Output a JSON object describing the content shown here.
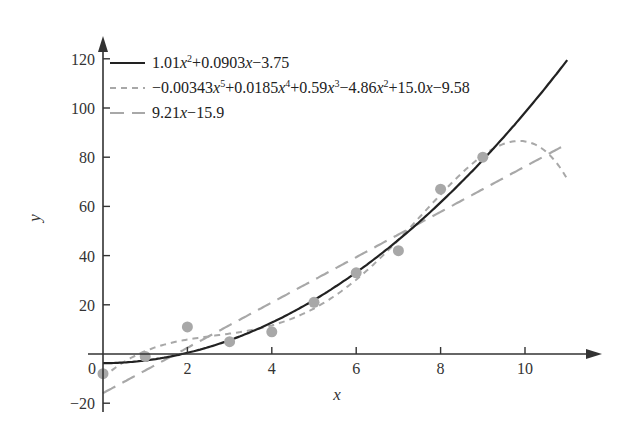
{
  "chart_data": {
    "type": "scatter",
    "title": "",
    "xlabel": "x",
    "ylabel": "y",
    "xlim": [
      0,
      11.5
    ],
    "ylim": [
      -22,
      125
    ],
    "x_ticks": [
      "0",
      "2",
      "4",
      "6",
      "8",
      "10"
    ],
    "y_ticks": [
      "-20",
      "0",
      "20",
      "40",
      "60",
      "80",
      "100",
      "120"
    ],
    "grid": false,
    "legend_position": "upper left",
    "points": {
      "x": [
        0,
        1,
        2,
        3,
        4,
        5,
        6,
        7,
        8,
        9
      ],
      "y": [
        -8,
        -1,
        11,
        5,
        9,
        21,
        33,
        42,
        67,
        80
      ]
    },
    "series": [
      {
        "name": "1.01x²+0.0903x−3.75",
        "style": "solid",
        "color": "#222222",
        "coefficients": [
          1.01,
          0.0903,
          -3.75
        ],
        "x_range": [
          0,
          11
        ]
      },
      {
        "name": "−0.00343x⁵+0.0185x⁴+0.59x³−4.86x²+15.0x−9.58",
        "style": "dotted-dash",
        "color": "#aaaaaa",
        "coefficients": [
          -0.00343,
          0.0185,
          0.59,
          -4.86,
          15.0,
          -9.58
        ],
        "x_range": [
          0,
          11
        ]
      },
      {
        "name": "9.21x−15.9",
        "style": "long-dash",
        "color": "#aaaaaa",
        "coefficients": [
          9.21,
          -15.9
        ],
        "x_range": [
          0,
          11
        ]
      }
    ]
  },
  "legend": {
    "quad": [
      "1.01",
      "x",
      "2",
      "+0.0903",
      "x",
      "−3.75"
    ],
    "quint": [
      "−0.00343",
      "x",
      "5",
      "+0.0185",
      "x",
      "4",
      "+0.59",
      "x",
      "3",
      "−4.86",
      "x",
      "2",
      "+15.0",
      "x",
      "−9.58"
    ],
    "lin": [
      "9.21",
      "x",
      "−15.9"
    ]
  },
  "colors": {
    "axis": "#333333",
    "points": "#a8a8a8",
    "solid": "#222222",
    "dashed": "#a8a8a8"
  }
}
